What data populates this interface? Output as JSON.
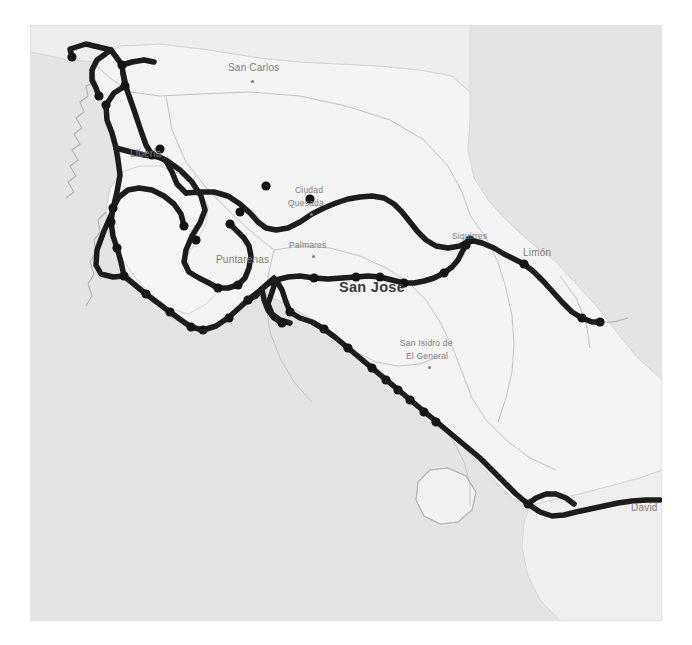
{
  "map": {
    "region": "Costa Rica",
    "background_color": "#ffffff",
    "land_color": "#f4f4f4",
    "sea_color": "#e2e2e2",
    "route_color": "#1c1c1c",
    "node_color": "#141414",
    "border_color": "#b6b6b6",
    "label_color": "#7b7b7b",
    "capital_label_color": "#3a3a3a",
    "canvas": {
      "width": 692,
      "height": 645
    },
    "extent": {
      "x": 30,
      "y": 25,
      "width": 632,
      "height": 596
    }
  },
  "labels": [
    {
      "name": "san-carlos",
      "text": "San Carlos",
      "x": 228,
      "y": 63,
      "style": "small",
      "dot_x": 251,
      "dot_y": 80
    },
    {
      "name": "liberia",
      "text": "Liberia",
      "x": 130,
      "y": 149,
      "style": "small",
      "dot_x": null,
      "dot_y": null
    },
    {
      "name": "ciudad-quesada-line1",
      "text": "Ciudad",
      "x": 295,
      "y": 186,
      "style": "tiny",
      "dot_x": null,
      "dot_y": null
    },
    {
      "name": "ciudad-quesada-line2",
      "text": "Quesada",
      "x": 288,
      "y": 199,
      "style": "tiny",
      "dot_x": 310,
      "dot_y": 213
    },
    {
      "name": "palmares",
      "text": "Palmares",
      "x": 289,
      "y": 241,
      "style": "tiny",
      "dot_x": 312,
      "dot_y": 255
    },
    {
      "name": "puntarenas",
      "text": "Puntarenas",
      "x": 216,
      "y": 255,
      "style": "small",
      "dot_x": null,
      "dot_y": null
    },
    {
      "name": "siquirres",
      "text": "Siquirres",
      "x": 452,
      "y": 232,
      "style": "tiny",
      "dot_x": null,
      "dot_y": null
    },
    {
      "name": "limon",
      "text": "Limón",
      "x": 523,
      "y": 248,
      "style": "small",
      "dot_x": null,
      "dot_y": null
    },
    {
      "name": "san-jose",
      "text": "San Jose",
      "x": 339,
      "y": 280,
      "style": "capital",
      "dot_x": null,
      "dot_y": null
    },
    {
      "name": "san-isidro-line1",
      "text": "San Isidro de",
      "x": 400,
      "y": 339,
      "style": "tiny",
      "dot_x": null,
      "dot_y": null
    },
    {
      "name": "san-isidro-line2",
      "text": "El General",
      "x": 406,
      "y": 352,
      "style": "tiny",
      "dot_x": 428,
      "dot_y": 366
    },
    {
      "name": "david",
      "text": "David",
      "x": 631,
      "y": 503,
      "style": "small",
      "dot_x": null,
      "dot_y": null
    }
  ],
  "route": {
    "stroke_width": 5.5,
    "node_radius": 4.6,
    "paths": [
      {
        "name": "northwest-loop",
        "d": "M 72,57 L 70,49 L 86,44 L 111,50 L 122,65 L 123,73 L 125,86 L 114,93 L 106,105 L 107,120 L 112,133 L 116,148 L 118,160 L 120,175 L 117,192 L 112,213 L 104,231 L 97,250 L 96,265 L 101,274 L 113,277 L 124,276"
      },
      {
        "name": "west-coast-spur",
        "d": "M 111,50 L 97,60 L 92,70 L 92,80 L 96,88 L 99,96"
      },
      {
        "name": "liberia-link",
        "d": "M 116,148 L 131,152 L 144,155 L 160,157 L 166,161 L 172,172 L 177,184 L 186,193"
      },
      {
        "name": "liberia-north",
        "d": "M 123,73 L 127,90 L 134,110 L 140,128 L 146,145 L 152,155"
      },
      {
        "name": "peninsula-loop",
        "d": "M 152,155 L 166,160 L 180,170 L 192,182 L 201,196 L 205,210 L 200,223 L 192,236 L 186,250 L 184,262 L 189,272 L 199,278 L 209,283 L 218,288"
      },
      {
        "name": "nicoya-west",
        "d": "M 124,276 L 121,262 L 117,248 L 113,236 L 111,222 L 113,208 L 119,197 L 128,190 L 139,188 L 152,190 L 164,196 L 174,204 L 181,214 L 184,226"
      },
      {
        "name": "nicoya-south",
        "d": "M 124,276 L 135,285 L 146,294 L 158,303 L 170,312 L 181,320 L 191,327 L 203,330 L 216,326 L 228,318 L 238,309 L 248,300 L 258,292 L 266,285 L 274,278"
      },
      {
        "name": "puntarenas-spur",
        "d": "M 218,288 L 228,288 L 238,285 L 245,278 L 249,268 L 251,256 L 249,246 L 244,238 L 237,231 L 230,224"
      },
      {
        "name": "central-corridor",
        "d": "M 248,300 L 256,296 L 262,289 L 268,284 L 276,280 L 288,277 L 300,276 L 314,278 L 328,279 L 342,278 L 356,277 L 368,276 L 380,277 L 392,280 L 404,283 L 414,283 L 424,281 L 434,278 L 444,273 L 452,267 L 458,260 L 462,252 L 466,245 L 470,240"
      },
      {
        "name": "interamerican-north",
        "d": "M 186,193 L 200,192 L 214,192 L 228,196 L 240,204 L 250,213 L 258,222 L 266,228 L 276,230 L 288,228 L 300,222 L 312,214 L 324,208 L 336,203 L 348,199 L 360,197 L 372,196 L 384,198 L 394,204 L 402,212 L 410,222 L 418,232 L 426,240 L 436,246 L 448,248 L 460,246 L 470,240"
      },
      {
        "name": "limon-branch",
        "d": "M 470,240 L 482,243 L 494,248 L 504,254 L 514,259 L 524,264 L 534,272 L 544,282 L 553,292 L 562,302 L 572,312 L 582,318 L 592,322 L 600,322"
      },
      {
        "name": "pacific-south",
        "d": "M 276,280 L 282,290 L 286,302 L 290,312 L 300,318 L 312,322 L 324,329 L 336,338 L 348,348 L 360,358 L 372,368 L 384,378 L 396,388 L 408,398 L 420,408 L 432,418 L 444,428 L 456,438 L 468,448 L 480,458 L 492,470 L 504,482 L 516,494 L 528,504 L 540,512 L 552,516 L 564,515 L 576,512 L 590,509 L 604,506 L 618,503 L 632,501 L 646,500 L 660,500"
      },
      {
        "name": "san-jose-connector",
        "d": "M 276,280 L 272,292 L 268,304 L 272,314 L 280,320 L 290,323"
      },
      {
        "name": "pacific-inner",
        "d": "M 262,289 L 264,300 L 268,310 L 274,318 L 282,323"
      },
      {
        "name": "southern-spur",
        "d": "M 528,504 L 536,498 L 546,494 L 556,494 L 566,498 L 574,504"
      },
      {
        "name": "north-border-link",
        "d": "M 122,65 L 132,62 L 144,60 L 154,62"
      }
    ],
    "nodes": [
      {
        "name": "node-nw-1",
        "x": 72,
        "y": 57
      },
      {
        "name": "node-nw-2",
        "x": 99,
        "y": 96
      },
      {
        "name": "node-nw-3",
        "x": 122,
        "y": 65
      },
      {
        "name": "node-nw-4",
        "x": 125,
        "y": 86
      },
      {
        "name": "node-nw-5",
        "x": 106,
        "y": 105
      },
      {
        "name": "node-liberia-a",
        "x": 152,
        "y": 155
      },
      {
        "name": "node-liberia-b",
        "x": 160,
        "y": 149
      },
      {
        "name": "node-pen-1",
        "x": 113,
        "y": 208
      },
      {
        "name": "node-pen-2",
        "x": 111,
        "y": 222
      },
      {
        "name": "node-pen-3",
        "x": 117,
        "y": 248
      },
      {
        "name": "node-pen-4",
        "x": 124,
        "y": 276
      },
      {
        "name": "node-pen-5",
        "x": 146,
        "y": 294
      },
      {
        "name": "node-pen-6",
        "x": 170,
        "y": 312
      },
      {
        "name": "node-pen-7",
        "x": 191,
        "y": 327
      },
      {
        "name": "node-pen-8",
        "x": 203,
        "y": 330
      },
      {
        "name": "node-pen-9",
        "x": 184,
        "y": 226
      },
      {
        "name": "node-pen-10",
        "x": 196,
        "y": 240
      },
      {
        "name": "node-punt-1",
        "x": 218,
        "y": 288
      },
      {
        "name": "node-punt-2",
        "x": 230,
        "y": 224
      },
      {
        "name": "node-punt-3",
        "x": 238,
        "y": 285
      },
      {
        "name": "node-punt-4",
        "x": 240,
        "y": 212
      },
      {
        "name": "node-punt-5",
        "x": 248,
        "y": 300
      },
      {
        "name": "node-punt-6",
        "x": 229,
        "y": 318
      },
      {
        "name": "node-ne-1",
        "x": 266,
        "y": 186
      },
      {
        "name": "node-ne-2",
        "x": 310,
        "y": 199
      },
      {
        "name": "node-central-1",
        "x": 314,
        "y": 278
      },
      {
        "name": "node-central-2",
        "x": 356,
        "y": 277
      },
      {
        "name": "node-central-3",
        "x": 380,
        "y": 277
      },
      {
        "name": "node-central-4",
        "x": 404,
        "y": 283
      },
      {
        "name": "node-central-5",
        "x": 444,
        "y": 273
      },
      {
        "name": "node-central-6",
        "x": 466,
        "y": 245
      },
      {
        "name": "node-siquirres",
        "x": 470,
        "y": 240
      },
      {
        "name": "node-limon",
        "x": 524,
        "y": 264
      },
      {
        "name": "node-caribe-1",
        "x": 582,
        "y": 318
      },
      {
        "name": "node-caribe-2",
        "x": 600,
        "y": 322
      },
      {
        "name": "node-pac-1",
        "x": 290,
        "y": 312
      },
      {
        "name": "node-pac-2",
        "x": 282,
        "y": 323
      },
      {
        "name": "node-pac-3",
        "x": 324,
        "y": 329
      },
      {
        "name": "node-pac-4",
        "x": 348,
        "y": 348
      },
      {
        "name": "node-pac-5",
        "x": 372,
        "y": 368
      },
      {
        "name": "node-pac-6",
        "x": 386,
        "y": 380
      },
      {
        "name": "node-pac-7",
        "x": 398,
        "y": 390
      },
      {
        "name": "node-pac-8",
        "x": 410,
        "y": 400
      },
      {
        "name": "node-pac-9",
        "x": 424,
        "y": 412
      },
      {
        "name": "node-pac-10",
        "x": 436,
        "y": 422
      },
      {
        "name": "node-david",
        "x": 528,
        "y": 504
      }
    ]
  }
}
